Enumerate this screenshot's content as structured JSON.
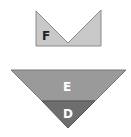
{
  "shapes": {
    "top_shape": {
      "label": "F",
      "fill": "#c8c8c8",
      "stroke": "#888888"
    },
    "triangle_upper": {
      "label": "E",
      "fill": "#9a9a9a",
      "stroke": "#777777"
    },
    "triangle_lower": {
      "label": "D",
      "fill": "#6e6e6e",
      "stroke": "#555555"
    }
  }
}
